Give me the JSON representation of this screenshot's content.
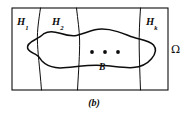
{
  "figure": {
    "caption": "(b)",
    "domain_label": "Ω",
    "set_label": "B",
    "ellipsis_dots": 3,
    "regions": [
      {
        "base": "H",
        "subscript": "1",
        "label": "H1"
      },
      {
        "base": "H",
        "subscript": "2",
        "label": "H2"
      },
      {
        "base": "H",
        "subscript": "k",
        "label": "Hk"
      }
    ],
    "colors": {
      "ink": "#0d0d0d",
      "background": "#ffffff"
    },
    "geometry": {
      "rect": {
        "x": 12,
        "y": 8,
        "width": 156,
        "height": 82
      },
      "partition_curves": [
        "M 40.5 8 C 38.6 21 37.2 30 37.4 40 C 37.6 52 39.6 66 41.5 90",
        "M 76.5 8 C 77.8 20 79.4 30 79.6 40 C 79.8 54 78.6 70 77.5 90",
        "M 140.5 8 C 139.6 22 139.0 34 139.2 47 C 139.4 62 140.0 76 140.5 90"
      ],
      "blob_outline": "M 44.0 33.6 C 48.0 31.0 54.0 31.3 60.0 33.2 C 66.0 35.1 71.0 36.4 76.5 35.4 C 83.0 34.2 88.5 31.2 95.0 29.8 C 102.0 28.3 110.0 29.4 117.5 31.6 C 125.5 33.9 131.0 36.9 137.5 38.5 C 144.5 40.2 150.5 41.5 153.5 45.0 C 156.6 48.6 155.5 54.0 151.5 58.8 C 147.4 63.7 141.0 67.0 133.0 67.6 C 125.0 68.2 116.0 66.6 107.5 65.8 C 98.0 64.9 88.0 65.3 79.0 66.3 C 70.0 67.3 62.0 68.6 55.5 67.6 C 49.5 66.7 45.0 64.2 42.5 61.6 C 40.2 59.2 39.8 56.6 36.0 54.6 C 32.5 52.7 28.2 51.2 27.6 48.0 C 27.0 44.8 30.6 42.0 34.5 40.0 C 38.2 38.1 41.4 36.3 44.0 33.6 Z",
      "dots": [
        {
          "cx": 92,
          "cy": 52,
          "r": 1.9
        },
        {
          "cx": 105,
          "cy": 52,
          "r": 1.9
        },
        {
          "cx": 118,
          "cy": 52,
          "r": 1.9
        }
      ]
    }
  }
}
